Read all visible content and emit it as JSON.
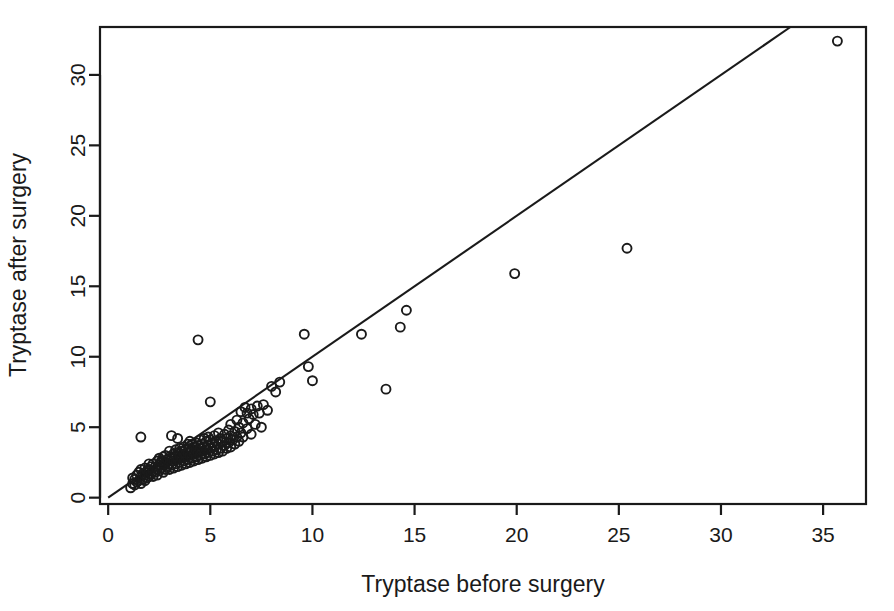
{
  "chart_data": {
    "type": "scatter",
    "title": "",
    "xlabel": "Tryptase before surgery",
    "ylabel": "Tryptase after surgery",
    "xlim": [
      -0.4,
      37.1
    ],
    "ylim": [
      -0.45,
      33.4
    ],
    "xticks": [
      0,
      5,
      10,
      15,
      20,
      25,
      30,
      35
    ],
    "yticks": [
      0,
      5,
      10,
      15,
      20,
      25,
      30
    ],
    "xtick_labels": [
      "0",
      "5",
      "10",
      "15",
      "20",
      "25",
      "30",
      "35"
    ],
    "ytick_labels": [
      "0",
      "5",
      "10",
      "15",
      "20",
      "25",
      "30"
    ],
    "grid": false,
    "legend": null,
    "marker": "open-circle",
    "marker_size_px": 9,
    "marker_color": "#1a1a1a",
    "box_frame": true,
    "reference_line": {
      "label": "identity line",
      "x0": 0.0,
      "y0": 0.0,
      "x1": 33.4,
      "y1": 33.4,
      "color": "#1a1a1a"
    },
    "series": [
      {
        "name": "patients",
        "points": [
          [
            1.1,
            0.7
          ],
          [
            1.2,
            1.0
          ],
          [
            1.2,
            1.4
          ],
          [
            1.3,
            0.9
          ],
          [
            1.3,
            1.3
          ],
          [
            1.4,
            1.1
          ],
          [
            1.4,
            1.6
          ],
          [
            1.5,
            1.2
          ],
          [
            1.5,
            1.8
          ],
          [
            1.6,
            1.0
          ],
          [
            1.6,
            1.5
          ],
          [
            1.6,
            2.0
          ],
          [
            1.7,
            1.3
          ],
          [
            1.7,
            1.7
          ],
          [
            1.8,
            1.2
          ],
          [
            1.8,
            1.6
          ],
          [
            1.8,
            2.1
          ],
          [
            1.9,
            1.4
          ],
          [
            1.9,
            1.9
          ],
          [
            2.0,
            1.5
          ],
          [
            2.0,
            2.0
          ],
          [
            2.0,
            2.4
          ],
          [
            2.1,
            1.7
          ],
          [
            2.1,
            2.2
          ],
          [
            2.2,
            1.5
          ],
          [
            2.2,
            1.9
          ],
          [
            2.2,
            2.4
          ],
          [
            2.3,
            1.8
          ],
          [
            2.3,
            2.2
          ],
          [
            2.4,
            1.6
          ],
          [
            2.4,
            2.0
          ],
          [
            2.4,
            2.6
          ],
          [
            2.5,
            1.9
          ],
          [
            2.5,
            2.3
          ],
          [
            2.5,
            2.8
          ],
          [
            2.6,
            2.1
          ],
          [
            2.6,
            2.5
          ],
          [
            2.7,
            1.8
          ],
          [
            2.7,
            2.3
          ],
          [
            2.7,
            2.9
          ],
          [
            2.8,
            2.0
          ],
          [
            2.8,
            2.5
          ],
          [
            2.8,
            3.0
          ],
          [
            2.9,
            2.2
          ],
          [
            2.9,
            2.7
          ],
          [
            3.0,
            2.0
          ],
          [
            3.0,
            2.4
          ],
          [
            3.0,
            2.9
          ],
          [
            3.0,
            3.3
          ],
          [
            3.1,
            2.3
          ],
          [
            3.1,
            2.8
          ],
          [
            3.2,
            2.1
          ],
          [
            3.2,
            2.6
          ],
          [
            3.2,
            3.1
          ],
          [
            3.3,
            2.4
          ],
          [
            3.3,
            2.9
          ],
          [
            3.3,
            3.4
          ],
          [
            3.4,
            2.2
          ],
          [
            3.4,
            2.7
          ],
          [
            3.4,
            3.2
          ],
          [
            3.5,
            2.5
          ],
          [
            3.5,
            3.0
          ],
          [
            3.5,
            3.5
          ],
          [
            3.6,
            2.3
          ],
          [
            3.6,
            2.8
          ],
          [
            3.6,
            3.3
          ],
          [
            3.7,
            2.6
          ],
          [
            3.7,
            3.1
          ],
          [
            3.7,
            3.6
          ],
          [
            3.8,
            2.4
          ],
          [
            3.8,
            2.9
          ],
          [
            3.8,
            3.4
          ],
          [
            3.9,
            2.7
          ],
          [
            3.9,
            3.2
          ],
          [
            3.9,
            3.8
          ],
          [
            4.0,
            2.5
          ],
          [
            4.0,
            3.0
          ],
          [
            4.0,
            3.5
          ],
          [
            4.0,
            4.0
          ],
          [
            4.1,
            2.8
          ],
          [
            4.1,
            3.3
          ],
          [
            4.1,
            3.8
          ],
          [
            4.2,
            2.6
          ],
          [
            4.2,
            3.1
          ],
          [
            4.2,
            3.6
          ],
          [
            4.3,
            2.9
          ],
          [
            4.3,
            3.4
          ],
          [
            4.3,
            3.9
          ],
          [
            4.4,
            2.7
          ],
          [
            4.4,
            3.2
          ],
          [
            4.4,
            3.7
          ],
          [
            4.4,
            11.2
          ],
          [
            4.5,
            3.0
          ],
          [
            4.5,
            3.5
          ],
          [
            4.5,
            4.1
          ],
          [
            4.6,
            2.8
          ],
          [
            4.6,
            3.3
          ],
          [
            4.6,
            3.8
          ],
          [
            4.7,
            3.1
          ],
          [
            4.7,
            3.6
          ],
          [
            4.7,
            4.2
          ],
          [
            4.8,
            2.9
          ],
          [
            4.8,
            3.4
          ],
          [
            4.8,
            4.0
          ],
          [
            4.9,
            3.2
          ],
          [
            4.9,
            3.7
          ],
          [
            4.9,
            4.3
          ],
          [
            5.0,
            3.0
          ],
          [
            5.0,
            3.5
          ],
          [
            5.0,
            4.1
          ],
          [
            5.0,
            6.8
          ],
          [
            5.1,
            3.3
          ],
          [
            5.1,
            3.9
          ],
          [
            5.2,
            3.1
          ],
          [
            5.2,
            3.6
          ],
          [
            5.2,
            4.4
          ],
          [
            5.3,
            3.4
          ],
          [
            5.3,
            4.0
          ],
          [
            5.4,
            3.2
          ],
          [
            5.4,
            3.8
          ],
          [
            5.4,
            4.6
          ],
          [
            5.5,
            3.5
          ],
          [
            5.5,
            4.2
          ],
          [
            5.6,
            3.3
          ],
          [
            5.6,
            4.0
          ],
          [
            5.7,
            3.7
          ],
          [
            5.7,
            4.5
          ],
          [
            5.8,
            3.5
          ],
          [
            5.8,
            4.2
          ],
          [
            5.9,
            3.9
          ],
          [
            5.9,
            4.8
          ],
          [
            6.0,
            3.6
          ],
          [
            6.0,
            4.4
          ],
          [
            6.0,
            5.2
          ],
          [
            6.1,
            4.1
          ],
          [
            6.2,
            3.8
          ],
          [
            6.2,
            4.7
          ],
          [
            6.3,
            4.3
          ],
          [
            6.3,
            5.5
          ],
          [
            6.4,
            4.0
          ],
          [
            6.4,
            5.0
          ],
          [
            6.5,
            4.6
          ],
          [
            6.5,
            6.1
          ],
          [
            6.6,
            4.3
          ],
          [
            6.6,
            5.3
          ],
          [
            6.7,
            6.4
          ],
          [
            6.8,
            4.9
          ],
          [
            6.8,
            6.0
          ],
          [
            6.9,
            5.6
          ],
          [
            7.0,
            4.5
          ],
          [
            7.0,
            6.3
          ],
          [
            7.1,
            5.9
          ],
          [
            7.2,
            5.2
          ],
          [
            7.3,
            6.5
          ],
          [
            7.4,
            6.0
          ],
          [
            7.5,
            5.0
          ],
          [
            7.6,
            6.6
          ],
          [
            7.8,
            6.2
          ],
          [
            8.0,
            7.9
          ],
          [
            8.2,
            7.5
          ],
          [
            8.4,
            8.2
          ],
          [
            1.6,
            4.3
          ],
          [
            2.6,
            2.6
          ],
          [
            3.1,
            4.4
          ],
          [
            3.4,
            4.2
          ],
          [
            9.6,
            11.6
          ],
          [
            9.8,
            9.3
          ],
          [
            10.0,
            8.3
          ],
          [
            12.4,
            11.6
          ],
          [
            13.6,
            7.7
          ],
          [
            14.3,
            12.1
          ],
          [
            14.6,
            13.3
          ],
          [
            19.9,
            15.9
          ],
          [
            25.4,
            17.7
          ],
          [
            35.7,
            32.4
          ]
        ]
      }
    ]
  },
  "axes": {
    "x_label": "Tryptase before surgery",
    "y_label": "Tryptase after surgery"
  }
}
